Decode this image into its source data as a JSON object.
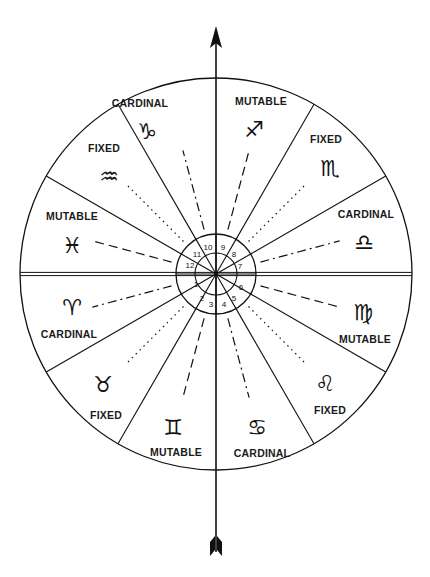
{
  "diagram": {
    "colors": {
      "ink": "#111111",
      "background": "#ffffff"
    },
    "center": [
      216,
      274
    ],
    "outer_radius": 196,
    "ring_outer_radius": 40,
    "ring_inner_radius": 21,
    "signs": [
      {
        "name": "Capricorn",
        "glyph": "♑",
        "icon": "capricorn-icon",
        "modality": "CARDINAL",
        "label_pos": [
          140,
          104
        ],
        "glyph_pos": [
          147,
          133
        ],
        "label_first": true
      },
      {
        "name": "Sagittarius",
        "glyph": "♐",
        "icon": "sagittarius-icon",
        "modality": "MUTABLE",
        "label_pos": [
          261,
          102
        ],
        "glyph_pos": [
          254,
          131
        ],
        "label_first": true
      },
      {
        "name": "Scorpio",
        "glyph": "♏",
        "icon": "scorpio-icon",
        "modality": "FIXED",
        "label_pos": [
          326,
          140
        ],
        "glyph_pos": [
          330,
          170
        ],
        "label_first": true
      },
      {
        "name": "Libra",
        "glyph": "♎",
        "icon": "libra-icon",
        "modality": "CARDINAL",
        "label_pos": [
          366,
          215
        ],
        "glyph_pos": [
          364,
          244
        ],
        "label_first": true
      },
      {
        "name": "Virgo",
        "glyph": "♍",
        "icon": "virgo-icon",
        "modality": "MUTABLE",
        "label_pos": [
          365,
          340
        ],
        "glyph_pos": [
          363,
          314
        ],
        "label_first": false
      },
      {
        "name": "Leo",
        "glyph": "♌",
        "icon": "leo-icon",
        "modality": "FIXED",
        "label_pos": [
          330,
          411
        ],
        "glyph_pos": [
          325,
          385
        ],
        "label_first": false
      },
      {
        "name": "Cancer",
        "glyph": "♋",
        "icon": "cancer-icon",
        "modality": "CARDINAL",
        "label_pos": [
          262,
          454
        ],
        "glyph_pos": [
          257,
          429
        ],
        "label_first": false
      },
      {
        "name": "Gemini",
        "glyph": "♊",
        "icon": "gemini-icon",
        "modality": "MUTABLE",
        "label_pos": [
          176,
          453
        ],
        "glyph_pos": [
          173,
          429
        ],
        "label_first": false
      },
      {
        "name": "Taurus",
        "glyph": "♉",
        "icon": "taurus-icon",
        "modality": "FIXED",
        "label_pos": [
          106,
          416
        ],
        "glyph_pos": [
          103,
          386
        ],
        "label_first": false
      },
      {
        "name": "Aries",
        "glyph": "♈",
        "icon": "aries-icon",
        "modality": "CARDINAL",
        "label_pos": [
          69,
          335
        ],
        "glyph_pos": [
          72,
          309
        ],
        "label_first": false
      },
      {
        "name": "Pisces",
        "glyph": "♓",
        "icon": "pisces-icon",
        "modality": "MUTABLE",
        "label_pos": [
          72,
          217
        ],
        "glyph_pos": [
          72,
          247
        ],
        "label_first": true
      },
      {
        "name": "Aquarius",
        "glyph": "♒",
        "icon": "aquarius-icon",
        "modality": "FIXED",
        "label_pos": [
          104,
          149
        ],
        "glyph_pos": [
          109,
          178
        ],
        "label_first": true
      }
    ],
    "houses": [
      {
        "n": "1",
        "pos": [
          196,
          285
        ]
      },
      {
        "n": "2",
        "pos": [
          202,
          299
        ]
      },
      {
        "n": "3",
        "pos": [
          211,
          305
        ]
      },
      {
        "n": "4",
        "pos": [
          224,
          305
        ]
      },
      {
        "n": "5",
        "pos": [
          234,
          299
        ]
      },
      {
        "n": "6",
        "pos": [
          241,
          288
        ]
      },
      {
        "n": "7",
        "pos": [
          240,
          267
        ]
      },
      {
        "n": "8",
        "pos": [
          234,
          255
        ]
      },
      {
        "n": "9",
        "pos": [
          223,
          248
        ]
      },
      {
        "n": "10",
        "pos": [
          208,
          248
        ]
      },
      {
        "n": "11",
        "pos": [
          197,
          255
        ]
      },
      {
        "n": "12",
        "pos": [
          190,
          266
        ]
      }
    ],
    "line_styles": {
      "CARDINAL": "dash-dot",
      "MUTABLE": "dashed",
      "FIXED": "dotted"
    },
    "arrow": {
      "tip_y": 26,
      "tail_y": 556,
      "x": 216
    }
  }
}
